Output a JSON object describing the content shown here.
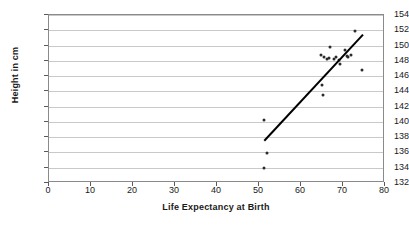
{
  "chart_data": {
    "type": "scatter",
    "title": "",
    "xlabel": "Life Expectancy at Birth",
    "ylabel": "Height in cm",
    "xlim": [
      0,
      80
    ],
    "ylim": [
      132,
      154
    ],
    "xticks": [
      0,
      10,
      20,
      30,
      40,
      50,
      60,
      70,
      80
    ],
    "yticks": [
      132,
      134,
      136,
      138,
      140,
      142,
      144,
      146,
      148,
      150,
      152,
      154
    ],
    "grid": "horizontal",
    "legend": "none",
    "marker_color": "#2b2b2b",
    "trendline_color": "#000000",
    "gridline_color": "#c9c9c9",
    "points": [
      {
        "x": 51.3,
        "y": 140.3
      },
      {
        "x": 51.8,
        "y": 135.9
      },
      {
        "x": 51.3,
        "y": 134.0
      },
      {
        "x": 65.1,
        "y": 144.8
      },
      {
        "x": 65.3,
        "y": 143.5
      },
      {
        "x": 64.7,
        "y": 148.8
      },
      {
        "x": 65.4,
        "y": 148.5
      },
      {
        "x": 66.1,
        "y": 148.3
      },
      {
        "x": 66.6,
        "y": 148.4
      },
      {
        "x": 67.0,
        "y": 149.8
      },
      {
        "x": 67.8,
        "y": 148.2
      },
      {
        "x": 68.4,
        "y": 148.5
      },
      {
        "x": 69.1,
        "y": 148.1
      },
      {
        "x": 69.4,
        "y": 147.6
      },
      {
        "x": 70.4,
        "y": 149.4
      },
      {
        "x": 70.9,
        "y": 148.6
      },
      {
        "x": 71.3,
        "y": 148.5
      },
      {
        "x": 71.8,
        "y": 148.7
      },
      {
        "x": 72.9,
        "y": 151.9
      },
      {
        "x": 74.5,
        "y": 146.8
      }
    ],
    "trendline": {
      "x0": 51.5,
      "y0": 137.4,
      "x1": 75.0,
      "y1": 151.3
    }
  }
}
